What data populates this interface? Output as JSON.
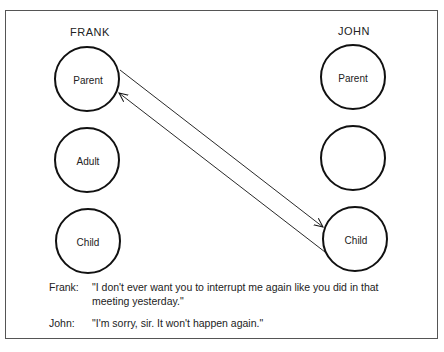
{
  "diagram": {
    "left_person": {
      "name": "FRANK",
      "states": [
        {
          "label": "Parent"
        },
        {
          "label": "Adult"
        },
        {
          "label": "Child"
        }
      ]
    },
    "right_person": {
      "name": "JOHN",
      "states": [
        {
          "label": "Parent"
        },
        {
          "label": ""
        },
        {
          "label": "Child"
        }
      ]
    },
    "transactions": [
      {
        "from": "FRANK.Parent",
        "to": "JOHN.Child"
      },
      {
        "from": "JOHN.Child",
        "to": "FRANK.Parent"
      }
    ]
  },
  "dialogue": [
    {
      "speaker": "Frank:",
      "text_line1": "\"I don't ever want you to interrupt me again like you did in that",
      "text_line2": "meeting yesterday.\""
    },
    {
      "speaker": "John:",
      "text_line1": "\"I'm sorry, sir.  It won't happen again.\""
    }
  ],
  "colors": {
    "stroke": "#111111",
    "text": "#222222",
    "background": "#ffffff",
    "frame": "#555555"
  }
}
